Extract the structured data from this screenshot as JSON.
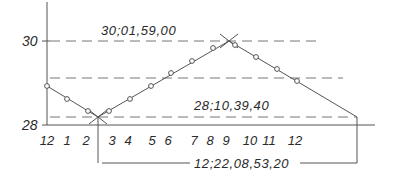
{
  "diagram": {
    "type": "year-length-variation",
    "y_axis": {
      "labels": [
        {
          "text": "30",
          "y": 41
        },
        {
          "text": "28",
          "y": 125
        }
      ]
    },
    "x_axis": {
      "months": [
        {
          "text": "12",
          "x": 47
        },
        {
          "text": "1",
          "x": 67
        },
        {
          "text": "2",
          "x": 86
        },
        {
          "text": "3",
          "x": 112
        },
        {
          "text": "4",
          "x": 128
        },
        {
          "text": "5",
          "x": 152
        },
        {
          "text": "6",
          "x": 168
        },
        {
          "text": "7",
          "x": 194
        },
        {
          "text": "8",
          "x": 210
        },
        {
          "text": "9",
          "x": 226
        },
        {
          "text": "10",
          "x": 250
        },
        {
          "text": "11",
          "x": 269
        },
        {
          "text": "12",
          "x": 295
        }
      ]
    },
    "annotations": {
      "max_value": "30;01,59,00",
      "min_value": "28;10,39,40",
      "period": "12;22,08,53,20"
    },
    "curve_points": [
      {
        "x": 47,
        "y": 86
      },
      {
        "x": 67,
        "y": 99
      },
      {
        "x": 88,
        "y": 111
      },
      {
        "x": 109,
        "y": 111
      },
      {
        "x": 130,
        "y": 99
      },
      {
        "x": 151,
        "y": 86
      },
      {
        "x": 171,
        "y": 73
      },
      {
        "x": 192,
        "y": 61
      },
      {
        "x": 213,
        "y": 48
      },
      {
        "x": 235,
        "y": 45
      },
      {
        "x": 256,
        "y": 57
      },
      {
        "x": 277,
        "y": 69
      },
      {
        "x": 297,
        "y": 81
      }
    ],
    "colors": {
      "line": "#555555",
      "dash": "#777777",
      "text": "#2a2a2a"
    }
  }
}
